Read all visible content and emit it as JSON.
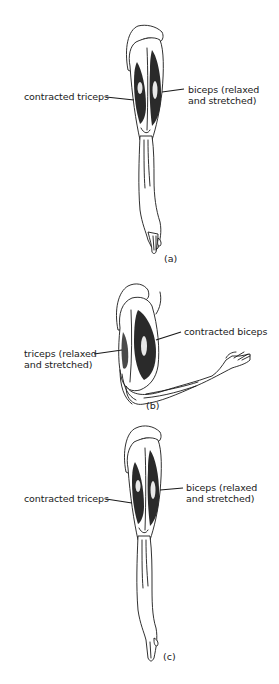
{
  "figures": [
    {
      "id": "a",
      "caption": "(a)",
      "pose": "arm extended, hanging straight down",
      "labels": {
        "left": [
          "contracted triceps"
        ],
        "right": [
          "biceps (relaxed",
          "and stretched)"
        ]
      }
    },
    {
      "id": "b",
      "caption": "(b)",
      "pose": "arm flexed at elbow, forearm extended to the right",
      "labels": {
        "left": [
          "triceps (relaxed",
          "and stretched)"
        ],
        "right": [
          "contracted biceps"
        ]
      }
    },
    {
      "id": "c",
      "caption": "(c)",
      "pose": "arm extended, hanging straight down",
      "labels": {
        "left": [
          "contracted triceps"
        ],
        "right": [
          "biceps (relaxed",
          "and stretched)"
        ]
      }
    }
  ]
}
